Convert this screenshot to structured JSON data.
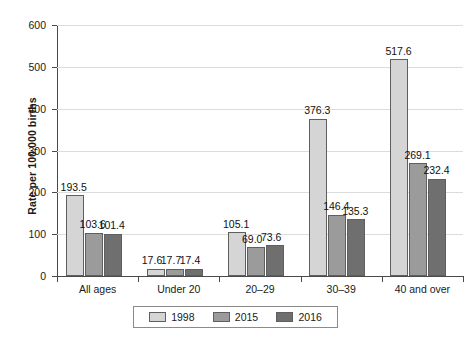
{
  "chart_data": {
    "type": "bar",
    "title": "",
    "xlabel": "",
    "ylabel": "Rate per 100,000 births",
    "ylim": [
      0,
      600
    ],
    "ytick_step": 100,
    "yticks": [
      0,
      100,
      200,
      300,
      400,
      500,
      600
    ],
    "ytick_labels": [
      "0",
      "100",
      "200",
      "300",
      "400",
      "500",
      "600"
    ],
    "grid": true,
    "legend_position": "bottom",
    "categories": [
      "All ages",
      "Under 20",
      "20–29",
      "30–39",
      "40 and over"
    ],
    "series": [
      {
        "name": "1998",
        "color": "#d5d5d5",
        "values": [
          193.5,
          17.6,
          105.1,
          376.3,
          517.6
        ],
        "labels": [
          "193.5",
          "17.6",
          "105.1",
          "376.3",
          "517.6"
        ]
      },
      {
        "name": "2015",
        "color": "#9b9b9b",
        "values": [
          103.6,
          17.7,
          69.0,
          146.4,
          269.1
        ],
        "labels": [
          "103.6",
          "17.7",
          "69.0",
          "146.4",
          "269.1"
        ]
      },
      {
        "name": "2016",
        "color": "#6f6f6f",
        "values": [
          101.4,
          17.4,
          73.6,
          135.3,
          232.4
        ],
        "labels": [
          "101.4",
          "17.4",
          "73.6",
          "135.3",
          "232.4"
        ]
      }
    ]
  },
  "legend": {
    "items": [
      {
        "label": "1998",
        "color": "#d5d5d5"
      },
      {
        "label": "2015",
        "color": "#9b9b9b"
      },
      {
        "label": "2016",
        "color": "#6f6f6f"
      }
    ]
  },
  "axes": {
    "y_title": "Rate per 100,000 births"
  }
}
